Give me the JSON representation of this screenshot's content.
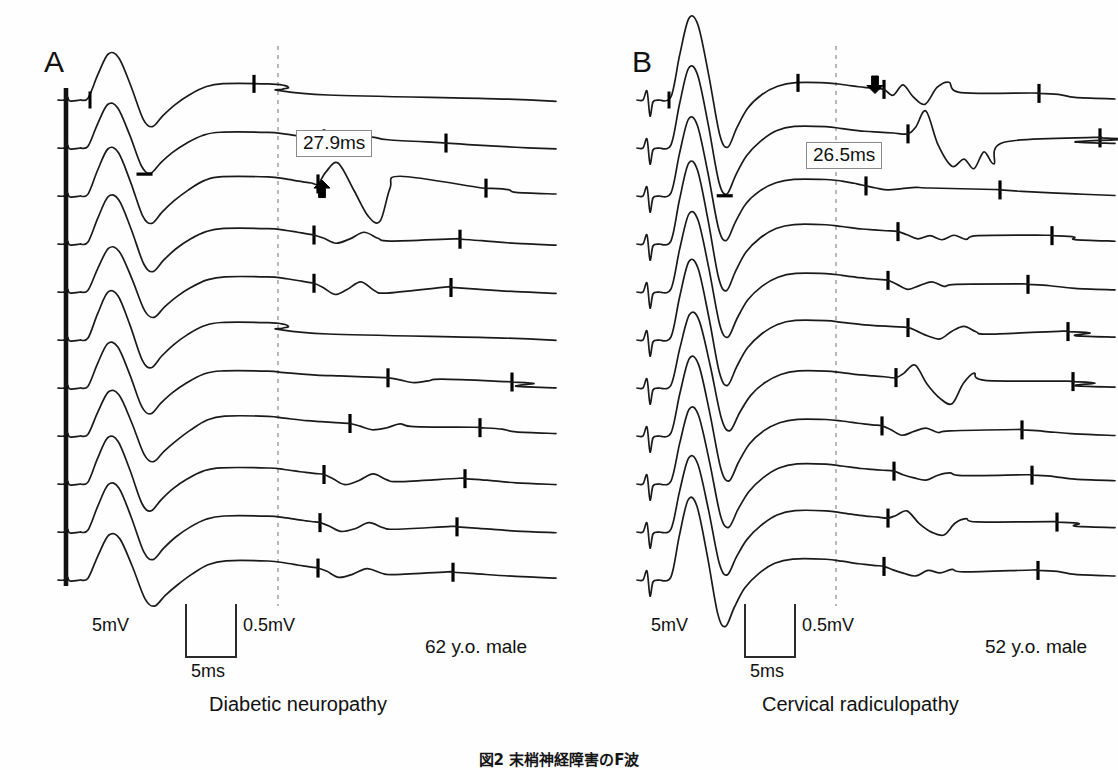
{
  "figure": {
    "type": "nerve-conduction-waveform-figure",
    "background_color": "#fefefe",
    "trace_color": "#1a1a1a",
    "marker_color": "#000000",
    "dashed_line_color": "#9a9a9a",
    "caption": "図2  末梢神経障害のF波"
  },
  "panels": [
    {
      "id": "A",
      "letter": "A",
      "diagnosis": "Diabetic neuropathy",
      "age_note": "62 y.o. male",
      "latency_label": "27.9ms",
      "arrow": {
        "name": "up-arrow",
        "direction": "up"
      },
      "trace_count": 11,
      "scale": {
        "amplitude_left": "5mV",
        "amplitude_right": "0.5mV",
        "time": "5ms"
      }
    },
    {
      "id": "B",
      "letter": "B",
      "diagnosis": "Cervical radiculopathy",
      "age_note": "52 y.o. male",
      "latency_label": "26.5ms",
      "arrow": {
        "name": "down-arrow",
        "direction": "down"
      },
      "trace_count": 11,
      "scale": {
        "amplitude_left": "5mV",
        "amplitude_right": "0.5mV",
        "time": "5ms"
      }
    }
  ],
  "chart_data": {
    "type": "line",
    "xlabel": "Time (ms)",
    "ylabel": "Amplitude (mV)",
    "legend": [],
    "grid": false,
    "annotations": [
      {
        "panel": "A",
        "text": "27.9ms",
        "kind": "F-wave minimal latency"
      },
      {
        "panel": "B",
        "text": "26.5ms",
        "kind": "F-wave minimal latency"
      }
    ],
    "series": [
      {
        "name": "A-sweep-1",
        "panel": "A",
        "f_latency_ms": 27.9
      },
      {
        "name": "A-sweep-2",
        "panel": "A",
        "f_latency_ms": 27.9
      },
      {
        "name": "A-sweep-3",
        "panel": "A",
        "f_latency_ms": 28.4
      },
      {
        "name": "A-sweep-4",
        "panel": "A",
        "f_latency_ms": 29.1
      },
      {
        "name": "A-sweep-5",
        "panel": "A",
        "f_latency_ms": 28.8
      },
      {
        "name": "A-sweep-6",
        "panel": "A",
        "f_latency_ms": null
      },
      {
        "name": "A-sweep-7",
        "panel": "A",
        "f_latency_ms": 30.2
      },
      {
        "name": "A-sweep-8",
        "panel": "A",
        "f_latency_ms": 29.5
      },
      {
        "name": "A-sweep-9",
        "panel": "A",
        "f_latency_ms": 28.6
      },
      {
        "name": "A-sweep-10",
        "panel": "A",
        "f_latency_ms": 28.9
      },
      {
        "name": "A-sweep-11",
        "panel": "A",
        "f_latency_ms": 29.0
      },
      {
        "name": "B-sweep-1",
        "panel": "B",
        "f_latency_ms": 26.5
      },
      {
        "name": "B-sweep-2",
        "panel": "B",
        "f_latency_ms": 27.0
      },
      {
        "name": "B-sweep-3",
        "panel": "B",
        "f_latency_ms": 27.4
      },
      {
        "name": "B-sweep-4",
        "panel": "B",
        "f_latency_ms": 28.0
      },
      {
        "name": "B-sweep-5",
        "panel": "B",
        "f_latency_ms": 27.2
      },
      {
        "name": "B-sweep-6",
        "panel": "B",
        "f_latency_ms": 27.6
      },
      {
        "name": "B-sweep-7",
        "panel": "B",
        "f_latency_ms": 27.1
      },
      {
        "name": "B-sweep-8",
        "panel": "B",
        "f_latency_ms": 26.9
      },
      {
        "name": "B-sweep-9",
        "panel": "B",
        "f_latency_ms": 27.3
      },
      {
        "name": "B-sweep-10",
        "panel": "B",
        "f_latency_ms": 27.5
      },
      {
        "name": "B-sweep-11",
        "panel": "B",
        "f_latency_ms": 27.0
      }
    ],
    "xlim": [
      0,
      50
    ],
    "ylim": [
      -5,
      5
    ]
  }
}
